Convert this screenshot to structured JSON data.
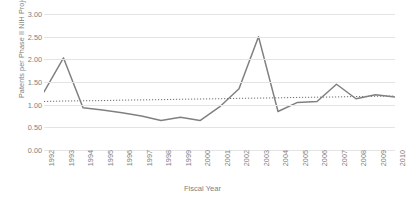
{
  "chart_data": {
    "type": "line",
    "title": "",
    "xlabel": "Fiscal Year",
    "ylabel": "Patents per Phase II NIH Project",
    "xlim": [
      1992,
      2010
    ],
    "ylim": [
      0.0,
      3.0
    ],
    "ytick_labels": [
      "3.00",
      "2.50",
      "2.00",
      "1.50",
      "1.00",
      "0.50",
      "0.00"
    ],
    "ytick_values": [
      3.0,
      2.5,
      2.0,
      1.5,
      1.0,
      0.5,
      0.0
    ],
    "grid": "horizontal",
    "legend": "none",
    "categories": [
      1992,
      1993,
      1994,
      1995,
      1996,
      1997,
      1998,
      1999,
      2000,
      2001,
      2002,
      2003,
      2004,
      2005,
      2006,
      2007,
      2008,
      2009,
      2010
    ],
    "xtick_labels": [
      "1992",
      "1993",
      "1994",
      "1995",
      "1996",
      "1997",
      "1998",
      "1999",
      "2000",
      "2001",
      "2002",
      "2003",
      "2004",
      "2005",
      "2006",
      "2007",
      "2008",
      "2009",
      "2010"
    ],
    "series": [
      {
        "name": "Patents per Phase II NIH Project",
        "style": "solid",
        "color": "#808080",
        "values": [
          1.28,
          2.03,
          0.93,
          0.88,
          0.82,
          0.75,
          0.65,
          0.72,
          0.65,
          0.95,
          1.35,
          2.5,
          0.85,
          1.05,
          1.07,
          1.45,
          1.13,
          1.22,
          1.17
        ]
      },
      {
        "name": "Trend line",
        "style": "dotted",
        "color": "#6e6e6e",
        "values": [
          1.07,
          1.08,
          1.085,
          1.09,
          1.1,
          1.105,
          1.11,
          1.12,
          1.125,
          1.13,
          1.14,
          1.145,
          1.15,
          1.16,
          1.165,
          1.17,
          1.18,
          1.185,
          1.19
        ]
      }
    ]
  },
  "colors": {
    "line": "#808080",
    "trend": "#6e6e6e",
    "grid": "#e4e4e4",
    "text": "#808080",
    "background": "#ffffff"
  }
}
